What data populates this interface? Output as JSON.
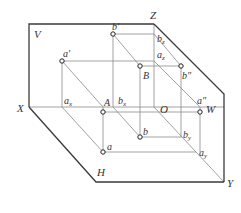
{
  "diagram": {
    "colors": {
      "frame": "#3a3a3a",
      "construction": "#8a8a8a",
      "point_fill": "#ffffff",
      "point_stroke": "#222222",
      "label": "#333333"
    },
    "planes": {
      "V": "V",
      "W": "W",
      "H": "H"
    },
    "axes": {
      "X": "X",
      "Y": "Y",
      "Z": "Z",
      "O": "O"
    },
    "points": {
      "A": "A",
      "B": "B",
      "a_prime": "a'",
      "b_prime": "b'",
      "a_double_prime": "a\"",
      "b_double_prime": "b\"",
      "a": "a",
      "b": "b"
    },
    "subscript_labels": {
      "a_x": {
        "base": "a",
        "sub": "x"
      },
      "b_x": {
        "base": "b",
        "sub": "x"
      },
      "a_z": {
        "base": "a",
        "sub": "z"
      },
      "b_z": {
        "base": "b",
        "sub": "z"
      },
      "a_y": {
        "base": "a",
        "sub": "y"
      },
      "b_y": {
        "base": "b",
        "sub": "y"
      }
    }
  }
}
